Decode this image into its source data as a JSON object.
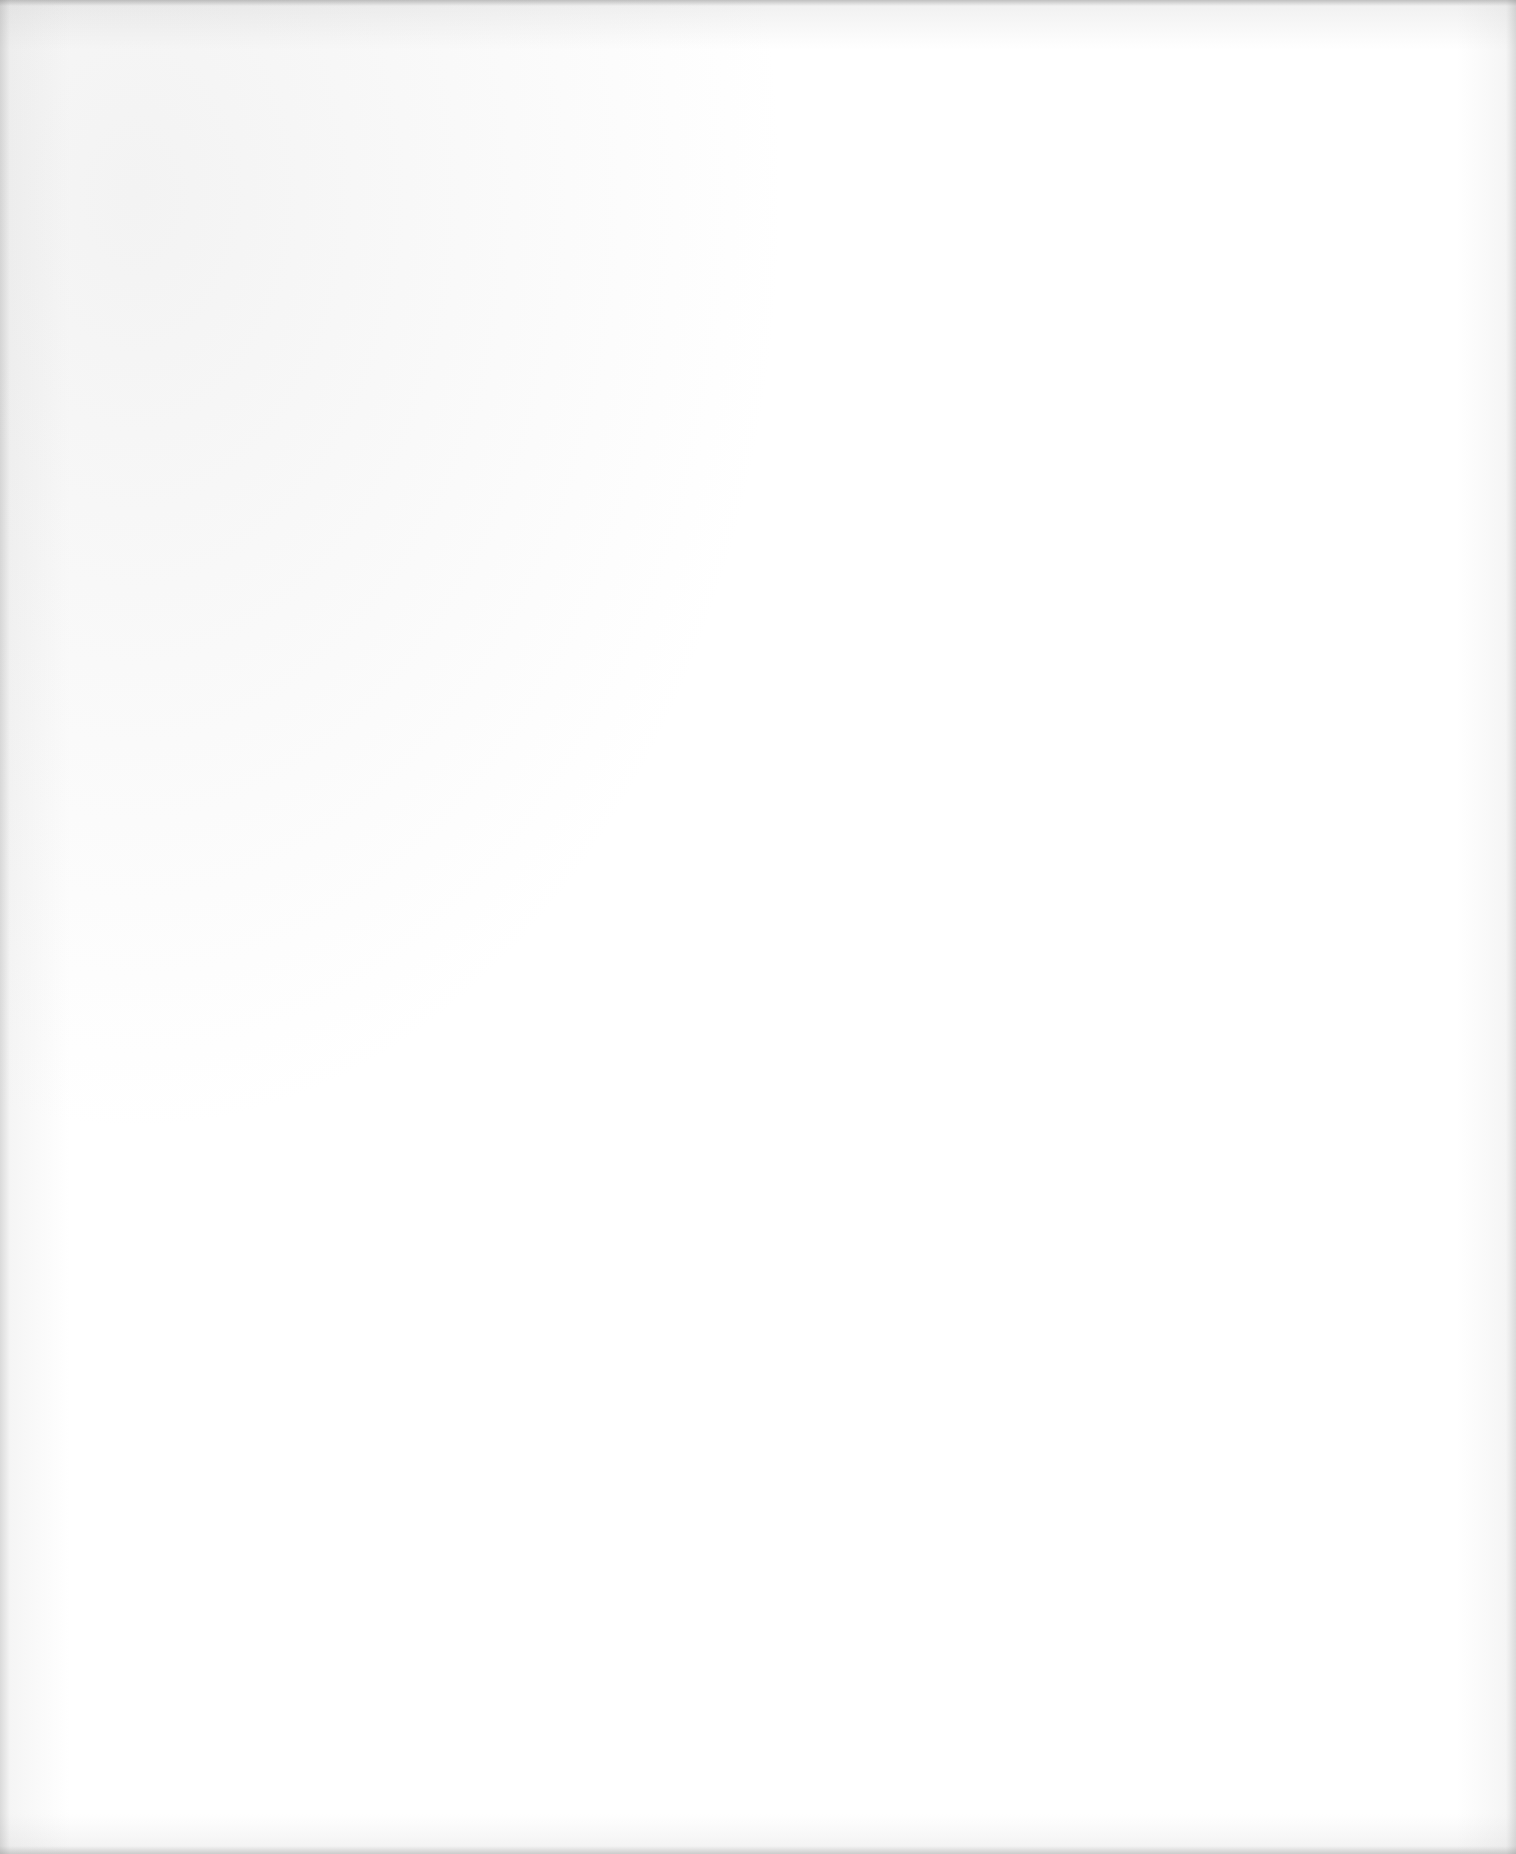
{
  "page": {
    "type": "blank-scanned-page",
    "text": "",
    "background_color": "#ffffff",
    "edge_shadow_color": "#9a9a9a"
  }
}
